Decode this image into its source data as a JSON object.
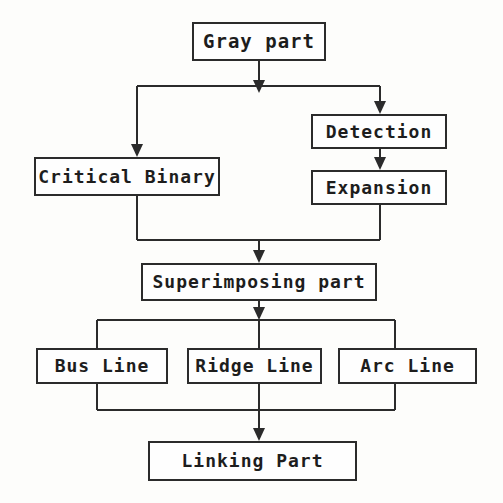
{
  "diagram": {
    "type": "flowchart",
    "colors": {
      "background": "#fdfdfb",
      "box_fill": "#fefefe",
      "stroke": "#2b2b2b",
      "text": "#1d1d1d"
    },
    "nodes": [
      {
        "id": "gray_part",
        "label": "Gray part",
        "x": 192,
        "y": 22,
        "w": 134,
        "h": 39,
        "font_size": 19
      },
      {
        "id": "detection",
        "label": "Detection",
        "x": 311,
        "y": 114,
        "w": 136,
        "h": 35,
        "font_size": 18
      },
      {
        "id": "critical_binary",
        "label": "Critical Binary",
        "x": 34,
        "y": 157,
        "w": 186,
        "h": 39,
        "font_size": 18
      },
      {
        "id": "expansion",
        "label": "Expansion",
        "x": 311,
        "y": 170,
        "w": 136,
        "h": 35,
        "font_size": 18
      },
      {
        "id": "superimposing_part",
        "label": "Superimposing part",
        "x": 141,
        "y": 263,
        "w": 236,
        "h": 38,
        "font_size": 18
      },
      {
        "id": "bus_line",
        "label": "Bus Line",
        "x": 36,
        "y": 348,
        "w": 132,
        "h": 36,
        "font_size": 18
      },
      {
        "id": "ridge_line",
        "label": "Ridge Line",
        "x": 187,
        "y": 348,
        "w": 135,
        "h": 36,
        "font_size": 18
      },
      {
        "id": "arc_line",
        "label": "Arc Line",
        "x": 338,
        "y": 348,
        "w": 139,
        "h": 36,
        "font_size": 18
      },
      {
        "id": "linking_part",
        "label": "Linking Part",
        "x": 148,
        "y": 441,
        "w": 209,
        "h": 40,
        "font_size": 18
      }
    ],
    "edges": [
      {
        "id": "gray-to-split",
        "from": "gray_part",
        "to": "split_bus_top"
      },
      {
        "id": "split-to-critical-binary",
        "from": "split_bus_top",
        "to": "critical_binary"
      },
      {
        "id": "split-to-detection",
        "from": "split_bus_top",
        "to": "detection"
      },
      {
        "id": "detection-to-expansion",
        "from": "detection",
        "to": "expansion"
      },
      {
        "id": "critical-binary-to-merge",
        "from": "critical_binary",
        "to": "merge_bus_mid"
      },
      {
        "id": "expansion-to-merge",
        "from": "expansion",
        "to": "merge_bus_mid"
      },
      {
        "id": "merge-to-superimposing",
        "from": "merge_bus_mid",
        "to": "superimposing_part"
      },
      {
        "id": "superimposing-to-bus-line",
        "from": "superimposing_part",
        "to": "bus_line"
      },
      {
        "id": "superimposing-to-ridge-line",
        "from": "superimposing_part",
        "to": "ridge_line"
      },
      {
        "id": "superimposing-to-arc-line",
        "from": "superimposing_part",
        "to": "arc_line"
      },
      {
        "id": "bus-line-to-linking",
        "from": "bus_line",
        "to": "linking_part"
      },
      {
        "id": "ridge-line-to-linking",
        "from": "ridge_line",
        "to": "linking_part"
      },
      {
        "id": "arc-line-to-linking",
        "from": "arc_line",
        "to": "linking_part"
      }
    ]
  }
}
